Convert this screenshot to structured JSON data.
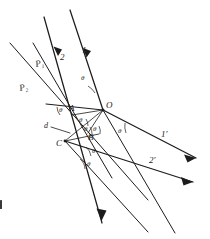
{
  "figure": {
    "background_color": "#ffffff",
    "ink_color": "#1c1c1c",
    "width": 210,
    "height": 239
  },
  "labels": {
    "ray_1": "1",
    "ray_2": "2",
    "ray_1_prime": "1'",
    "ray_2_prime": "2'",
    "wavefront_1": "P",
    "wavefront_1_sub": "1",
    "wavefront_2": "P",
    "wavefront_2_sub": "2",
    "point_O": "O",
    "point_A": "A",
    "point_B": "B",
    "point_C": "C",
    "distance_d": "d",
    "theta": "θ"
  },
  "angle_marks": [
    {
      "id": "theta-top-O",
      "label": "θ",
      "x": 81,
      "y": 80
    },
    {
      "id": "theta-left-A",
      "label": "θ",
      "x": 63,
      "y": 112
    },
    {
      "id": "theta-A-lower",
      "label": "θ",
      "x": 79,
      "y": 122
    },
    {
      "id": "theta-A-lower2",
      "label": "θ",
      "x": 84,
      "y": 131
    },
    {
      "id": "theta-B-upper",
      "label": "θ",
      "x": 92,
      "y": 130
    },
    {
      "id": "theta-right-O",
      "label": "θ",
      "x": 117,
      "y": 132
    },
    {
      "id": "theta-C-lower",
      "label": "θ",
      "x": 93,
      "y": 152
    },
    {
      "id": "theta-C-lower2",
      "label": "θ",
      "x": 88,
      "y": 165
    }
  ],
  "points": [
    {
      "id": "O",
      "label": "O",
      "x": 103,
      "y": 110
    },
    {
      "id": "A",
      "label": "A",
      "x": 72,
      "y": 112
    },
    {
      "id": "B",
      "label": "B",
      "x": 91,
      "y": 137
    },
    {
      "id": "C",
      "label": "C",
      "x": 65,
      "y": 141
    }
  ],
  "rays": [
    {
      "id": "ray-1",
      "label": "1",
      "label_x": 84,
      "label_y": 49
    },
    {
      "id": "ray-2",
      "label": "2",
      "label_x": 62,
      "label_y": 56
    },
    {
      "id": "ray-1-prime",
      "label": "1'",
      "label_x": 163,
      "label_y": 134
    },
    {
      "id": "ray-2-prime",
      "label": "2'",
      "label_x": 151,
      "label_y": 160
    }
  ],
  "wavefronts": [
    {
      "id": "P1",
      "base": "P",
      "subscript": "1",
      "x": 40,
      "y": 64
    },
    {
      "id": "P2",
      "base": "P",
      "subscript": "2",
      "x": 24,
      "y": 88
    }
  ]
}
